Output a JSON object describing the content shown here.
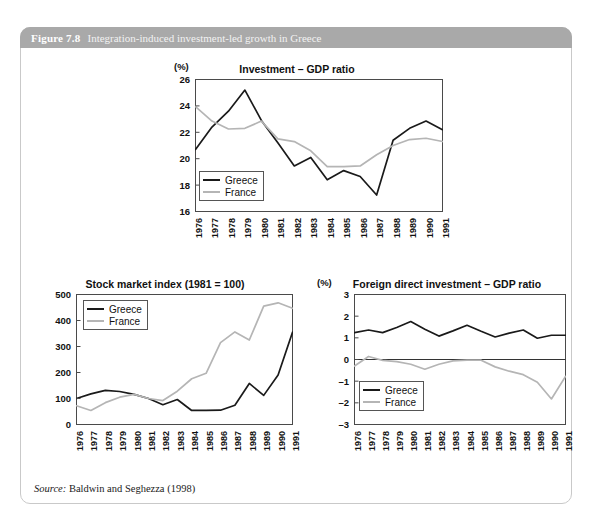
{
  "figure": {
    "number": "Figure 7.8",
    "caption": "Integration-induced investment-led growth in Greece",
    "source_label": "Source:",
    "source_text": " Baldwin and Seghezza (1998)",
    "header_color": "#a9a9a9",
    "border_color": "#c9c9c9"
  },
  "series_colors": {
    "greece": "#1a1a1a",
    "france": "#b5b5b5"
  },
  "legend": {
    "greece": "Greece",
    "france": "France"
  },
  "chart_data": [
    {
      "id": "investment-gdp-ratio",
      "type": "line",
      "title": "Investment – GDP ratio",
      "unit_label": "(%)",
      "xlabel": "",
      "ylabel": "",
      "grid": false,
      "legend_position": "bottom-left",
      "categories": [
        "1976",
        "1977",
        "1978",
        "1979",
        "1980",
        "1981",
        "1982",
        "1983",
        "1984",
        "1985",
        "1986",
        "1987",
        "1988",
        "1989",
        "1990",
        "1991"
      ],
      "yticks": [
        "16",
        "18",
        "20",
        "22",
        "24",
        "26"
      ],
      "ylim": [
        16,
        26
      ],
      "series": [
        {
          "name": "Greece",
          "values": [
            20.7,
            22.4,
            23.6,
            25.2,
            22.9,
            21.2,
            19.45,
            20.1,
            18.4,
            19.1,
            18.65,
            17.25,
            21.4,
            22.3,
            22.85,
            22.2
          ]
        },
        {
          "name": "France",
          "values": [
            23.95,
            22.85,
            22.25,
            22.3,
            22.85,
            21.5,
            21.3,
            20.6,
            19.4,
            19.4,
            19.45,
            20.3,
            21.0,
            21.45,
            21.55,
            21.3
          ]
        }
      ]
    },
    {
      "id": "stock-market-index",
      "type": "line",
      "title": "Stock market index (1981 = 100)",
      "unit_label": "",
      "xlabel": "",
      "ylabel": "",
      "grid": false,
      "legend_position": "top-left",
      "categories": [
        "1976",
        "1977",
        "1978",
        "1979",
        "1980",
        "1981",
        "1982",
        "1983",
        "1984",
        "1985",
        "1986",
        "1987",
        "1988",
        "1989",
        "1990",
        "1991"
      ],
      "yticks": [
        "0",
        "100",
        "200",
        "300",
        "400",
        "500"
      ],
      "ylim": [
        0,
        500
      ],
      "series": [
        {
          "name": "Greece",
          "values": [
            100,
            118,
            131,
            127,
            116,
            100,
            76,
            96,
            54,
            54,
            55,
            74,
            158,
            112,
            190,
            355
          ]
        },
        {
          "name": "France",
          "values": [
            72,
            54,
            84,
            105,
            116,
            100,
            92,
            128,
            176,
            197,
            315,
            356,
            325,
            455,
            468,
            447
          ]
        }
      ]
    },
    {
      "id": "fdi-gdp-ratio",
      "type": "line",
      "title": "Foreign direct investment – GDP ratio",
      "unit_label": "(%)",
      "xlabel": "",
      "ylabel": "",
      "grid": false,
      "legend_position": "bottom-left",
      "categories": [
        "1976",
        "1977",
        "1978",
        "1979",
        "1980",
        "1981",
        "1982",
        "1983",
        "1984",
        "1985",
        "1986",
        "1987",
        "1988",
        "1989",
        "1990",
        "1991"
      ],
      "yticks": [
        "–3",
        "–2",
        "–1",
        "0",
        "1",
        "2",
        "3"
      ],
      "ylim": [
        -3,
        3
      ],
      "series": [
        {
          "name": "Greece",
          "values": [
            1.24,
            1.36,
            1.24,
            1.48,
            1.75,
            1.4,
            1.08,
            1.32,
            1.58,
            1.3,
            1.04,
            1.22,
            1.36,
            0.98,
            1.12,
            1.12
          ]
        },
        {
          "name": "France",
          "values": [
            -0.3,
            0.14,
            -0.04,
            -0.1,
            -0.22,
            -0.45,
            -0.22,
            -0.06,
            -0.03,
            -0.03,
            -0.34,
            -0.54,
            -0.7,
            -1.05,
            -1.82,
            -0.78
          ]
        }
      ]
    }
  ]
}
